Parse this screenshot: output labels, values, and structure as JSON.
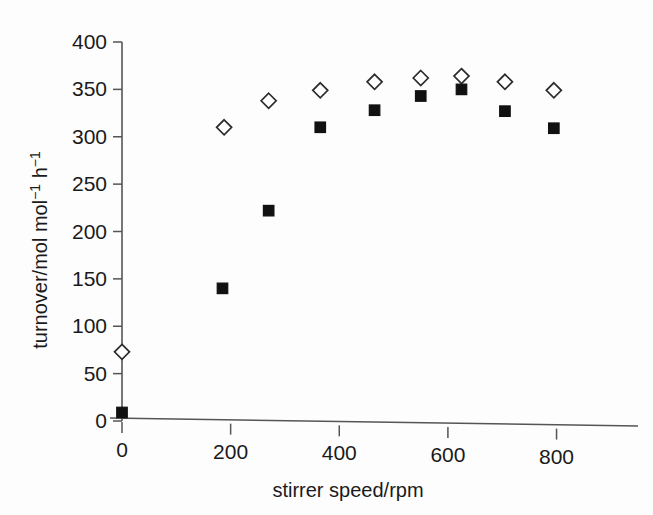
{
  "chart_data": {
    "type": "scatter",
    "title": "",
    "xlabel": "stirrer speed/rpm",
    "ylabel": "turnover/mol mol⁻¹ h⁻¹",
    "ylabel_parts": {
      "base1": "turnover/mol mol",
      "sup1": "−1",
      "base2": " h",
      "sup2": "−1"
    },
    "xlim": [
      0,
      880
    ],
    "ylim": [
      0,
      400
    ],
    "xticks": [
      0,
      200,
      400,
      600,
      800
    ],
    "xticklabels": [
      "0",
      "200",
      "400",
      "600",
      "800"
    ],
    "yticks": [
      0,
      50,
      100,
      150,
      200,
      250,
      300,
      350,
      400
    ],
    "yticklabels": [
      "0",
      "50",
      "100",
      "150",
      "200",
      "250",
      "300",
      "350",
      "400"
    ],
    "grid": false,
    "legend": "none",
    "series": [
      {
        "name": "open diamonds",
        "marker": "open-diamond",
        "color": "#2b2b2b",
        "x": [
          0,
          188,
          270,
          365,
          465,
          550,
          625,
          705,
          795
        ],
        "y": [
          73,
          310,
          338,
          349,
          358,
          362,
          364,
          358,
          349
        ]
      },
      {
        "name": "filled squares",
        "marker": "filled-square",
        "color": "#111111",
        "x": [
          0,
          185,
          270,
          365,
          465,
          550,
          625,
          705,
          795
        ],
        "y": [
          9,
          140,
          222,
          310,
          328,
          343,
          350,
          327,
          309
        ]
      }
    ]
  },
  "figure": {
    "background_color": "#fdfdfd",
    "axis_color": "#555555"
  }
}
